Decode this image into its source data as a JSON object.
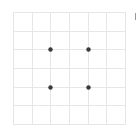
{
  "board": {
    "rows": 6,
    "cols": 6,
    "grid_color": "#e6e6e6",
    "dot_color": "#3a3a3a",
    "dots": [
      {
        "row": 2,
        "col": 2
      },
      {
        "row": 2,
        "col": 4
      },
      {
        "row": 4,
        "col": 2
      },
      {
        "row": 4,
        "col": 4
      }
    ]
  },
  "colors": {
    "background": "#ffffff",
    "edge_mark": "#9a9a9a"
  }
}
